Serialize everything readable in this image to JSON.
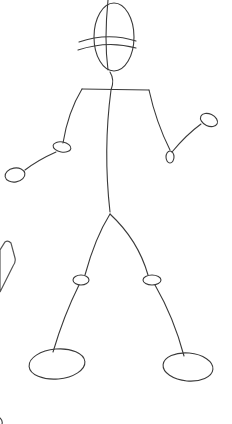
{
  "image": {
    "subject": "stick-figure-sketch",
    "background": "#ffffff",
    "stroke_color": "#3a3a3a",
    "ground_color": "#9a9a9a",
    "side_shape_color": "#c4c4c4",
    "parts": [
      "head",
      "hat-brim",
      "spine",
      "shoulders",
      "left-arm",
      "right-arm",
      "left-hand",
      "right-hand",
      "hips",
      "left-leg",
      "right-leg",
      "left-knee",
      "right-knee",
      "left-foot",
      "right-foot"
    ]
  }
}
